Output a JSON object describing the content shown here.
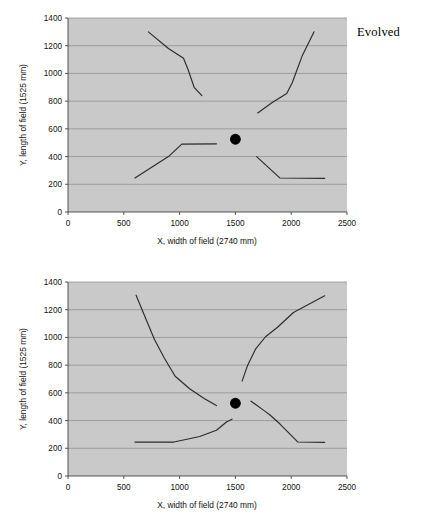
{
  "figure": {
    "panels": [
      {
        "id": "evolved",
        "label": "Evolved",
        "chart_data": {
          "type": "line",
          "title": "Evolved",
          "xlabel": "X, width of field (2740 mm)",
          "ylabel": "Y, length of field (1525 mm)",
          "xlim": [
            0,
            2500
          ],
          "ylim": [
            0,
            1400
          ],
          "xticks": [
            "0",
            "500",
            "1000",
            "1500",
            "2000",
            "2500"
          ],
          "yticks": [
            "0",
            "200",
            "400",
            "600",
            "800",
            "1000",
            "1200",
            "1400"
          ],
          "grid": "horizontal",
          "legend": "none",
          "plot_background": "#c9c9c9",
          "line_color": "#2b2b2b",
          "marker_color": "#000000",
          "markers": [
            {
              "name": "robot-start-position",
              "x": 1500,
              "y": 525,
              "shape": "filled-circle"
            }
          ],
          "series": [
            {
              "name": "path-upper-left",
              "points": [
                [
                  720,
                  1300
                ],
                [
                  900,
                  1180
                ],
                [
                  1035,
                  1110
                ],
                [
                  1075,
                  1030
                ],
                [
                  1130,
                  900
                ],
                [
                  1200,
                  840
                ]
              ]
            },
            {
              "name": "path-upper-right",
              "points": [
                [
                  1700,
                  715
                ],
                [
                  1830,
                  790
                ],
                [
                  1960,
                  855
                ],
                [
                  2010,
                  935
                ],
                [
                  2100,
                  1130
                ],
                [
                  2205,
                  1300
                ]
              ]
            },
            {
              "name": "path-lower-left",
              "points": [
                [
                  600,
                  245
                ],
                [
                  900,
                  400
                ],
                [
                  1020,
                  490
                ],
                [
                  1330,
                  492
                ]
              ]
            },
            {
              "name": "path-lower-right",
              "points": [
                [
                  1690,
                  400
                ],
                [
                  1900,
                  245
                ],
                [
                  2300,
                  243
                ]
              ]
            }
          ]
        }
      },
      {
        "id": "handcoded",
        "label": "Hand-coded",
        "chart_data": {
          "type": "line",
          "title": "Hand-coded",
          "xlabel": "X, width of field (2740 mm)",
          "ylabel": "Y, length of field (1525 mm)",
          "xlim": [
            0,
            2500
          ],
          "ylim": [
            0,
            1400
          ],
          "xticks": [
            "0",
            "500",
            "1000",
            "1500",
            "2000",
            "2500"
          ],
          "yticks": [
            "0",
            "200",
            "400",
            "600",
            "800",
            "1000",
            "1200",
            "1400"
          ],
          "grid": "horizontal",
          "legend": "none",
          "plot_background": "#c9c9c9",
          "line_color": "#2b2b2b",
          "marker_color": "#000000",
          "markers": [
            {
              "name": "robot-start-position",
              "x": 1500,
              "y": 525,
              "shape": "filled-circle"
            }
          ],
          "series": [
            {
              "name": "path-upper-left",
              "points": [
                [
                  610,
                  1305
                ],
                [
                  700,
                  1130
                ],
                [
                  775,
                  985
                ],
                [
                  860,
                  855
                ],
                [
                  960,
                  720
                ],
                [
                  1090,
                  630
                ],
                [
                  1220,
                  560
                ],
                [
                  1330,
                  508
                ]
              ]
            },
            {
              "name": "path-upper-right",
              "points": [
                [
                  1560,
                  685
                ],
                [
                  1610,
                  800
                ],
                [
                  1680,
                  915
                ],
                [
                  1770,
                  1005
                ],
                [
                  1880,
                  1075
                ],
                [
                  2020,
                  1180
                ],
                [
                  2300,
                  1300
                ]
              ]
            },
            {
              "name": "path-lower-left",
              "points": [
                [
                  600,
                  245
                ],
                [
                  950,
                  245
                ],
                [
                  1180,
                  285
                ],
                [
                  1330,
                  330
                ],
                [
                  1420,
                  390
                ],
                [
                  1470,
                  410
                ]
              ]
            },
            {
              "name": "path-lower-right",
              "points": [
                [
                  1640,
                  540
                ],
                [
                  1760,
                  470
                ],
                [
                  1810,
                  440
                ],
                [
                  1900,
                  375
                ],
                [
                  2060,
                  245
                ],
                [
                  2300,
                  243
                ]
              ]
            }
          ]
        }
      }
    ]
  }
}
